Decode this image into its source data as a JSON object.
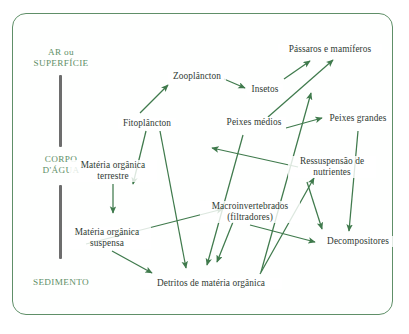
{
  "diagram": {
    "frame_color": "#5f8f68",
    "arrow_color": "#3f7a4c",
    "text_color": "#2f3b33",
    "zone_text_color": "#5f8f68",
    "bar_color": "#6d6d6d",
    "zones": [
      {
        "id": "ar",
        "lines": [
          "AR ou",
          "SUPERFÍCIE"
        ]
      },
      {
        "id": "corpo",
        "lines": [
          "CORPO",
          "D'ÁGUA"
        ]
      },
      {
        "id": "sedimento",
        "lines": [
          "SEDIMENTO"
        ]
      }
    ],
    "nodes": [
      {
        "id": "zooplancton",
        "lines": [
          "Zooplâncton"
        ]
      },
      {
        "id": "fitoplancton",
        "lines": [
          "Fitoplâncton"
        ]
      },
      {
        "id": "insetos",
        "lines": [
          "Insetos"
        ]
      },
      {
        "id": "passaros",
        "lines": [
          "Pássaros e mamíferos"
        ]
      },
      {
        "id": "peixes_medios",
        "lines": [
          "Peixes médios"
        ]
      },
      {
        "id": "peixes_grandes",
        "lines": [
          "Peixes grandes"
        ]
      },
      {
        "id": "ressuspensao",
        "lines": [
          "Ressuspensão de",
          "nutrientes"
        ]
      },
      {
        "id": "materia_terrestre",
        "lines": [
          "Matéria orgânica",
          "terrestre"
        ]
      },
      {
        "id": "materia_suspensa",
        "lines": [
          "Matéria orgânica",
          "suspensa"
        ]
      },
      {
        "id": "macroinvertebrados",
        "lines": [
          "Macroinvertebrados",
          "(filtradores)"
        ]
      },
      {
        "id": "detritos",
        "lines": [
          "Detritos de matéria orgânica"
        ]
      },
      {
        "id": "decompositores",
        "lines": [
          "Decompositores"
        ]
      }
    ],
    "edges": [
      {
        "from": "fitoplancton",
        "to": "zooplancton"
      },
      {
        "from": "zooplancton",
        "to": "insetos"
      },
      {
        "from": "insetos",
        "to": "passaros"
      },
      {
        "from": "peixes_medios",
        "to": "passaros"
      },
      {
        "from": "peixes_medios",
        "to": "peixes_grandes"
      },
      {
        "from": "detritos",
        "to": "zooplancton"
      },
      {
        "from": "fitoplancton",
        "to": "detritos"
      },
      {
        "from": "peixes_medios",
        "to": "detritos"
      },
      {
        "from": "materia_terrestre",
        "to": "materia_suspensa"
      },
      {
        "from": "materia_suspensa",
        "to": "detritos"
      },
      {
        "from": "detritos",
        "to": "macroinvertebrados"
      },
      {
        "from": "macroinvertebrados",
        "to": "detritos"
      },
      {
        "from": "macroinvertebrados",
        "to": "decompositores"
      },
      {
        "from": "decompositores",
        "to": "ressuspensao"
      },
      {
        "from": "peixes_grandes",
        "to": "decompositores"
      },
      {
        "from": "ressuspensao",
        "to": "decompositores"
      },
      {
        "from": "ressuspensao",
        "to": "peixes_medios"
      }
    ]
  }
}
